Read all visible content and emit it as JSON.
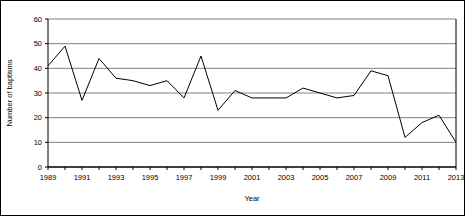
{
  "chart_data": {
    "type": "line",
    "title": "",
    "xlabel": "Year",
    "ylabel": "Number of baptisms",
    "xlim": [
      1989,
      2013
    ],
    "ylim": [
      0,
      60
    ],
    "grid": true,
    "legend": "none",
    "yticks": [
      0,
      10,
      20,
      30,
      40,
      50,
      60
    ],
    "xticks": [
      1989,
      1991,
      1993,
      1995,
      1997,
      1999,
      2001,
      2003,
      2005,
      2007,
      2009,
      2011,
      2013
    ],
    "x": [
      1989,
      1990,
      1991,
      1992,
      1993,
      1994,
      1995,
      1996,
      1997,
      1998,
      1999,
      2000,
      2001,
      2002,
      2003,
      2004,
      2005,
      2006,
      2007,
      2008,
      2009,
      2010,
      2011,
      2012,
      2013
    ],
    "series": [
      {
        "name": "Number of baptisms",
        "values": [
          41,
          49,
          27,
          44,
          36,
          35,
          33,
          35,
          28,
          45,
          23,
          31,
          28,
          28,
          28,
          32,
          30,
          28,
          29,
          39,
          37,
          12,
          18,
          21,
          10
        ]
      }
    ],
    "categories": [
      "1989",
      "1990",
      "1991",
      "1992",
      "1993",
      "1994",
      "1995",
      "1996",
      "1997",
      "1998",
      "1999",
      "2000",
      "2001",
      "2002",
      "2003",
      "2004",
      "2005",
      "2006",
      "2007",
      "2008",
      "2009",
      "2010",
      "2011",
      "2012",
      "2013"
    ],
    "values": [
      41,
      49,
      27,
      44,
      36,
      35,
      33,
      35,
      28,
      45,
      23,
      31,
      28,
      28,
      28,
      32,
      30,
      28,
      29,
      39,
      37,
      12,
      18,
      21,
      10
    ],
    "line_color": "#000000",
    "grid_color": "#808080",
    "axis_color": "#000000"
  }
}
